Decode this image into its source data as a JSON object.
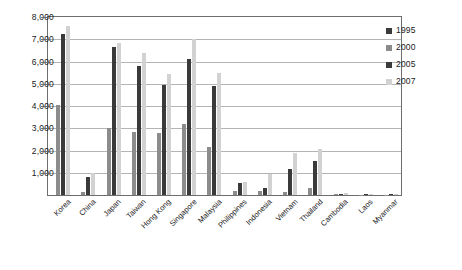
{
  "chart_data": {
    "type": "bar",
    "title": "",
    "subtitle": "",
    "xlabel": "",
    "ylabel": "",
    "ylim": [
      0,
      8000
    ],
    "yticks": [
      "0",
      "1,000",
      "2,000",
      "3,000",
      "4,000",
      "5,000",
      "6,000",
      "7,000",
      "8,000"
    ],
    "ytick_values": [
      0,
      1000,
      2000,
      3000,
      4000,
      5000,
      6000,
      7000,
      8000
    ],
    "grid": true,
    "legend_position": "right",
    "categories": [
      "Korea",
      "China",
      "Japan",
      "Taiwan",
      "Hong Kong",
      "Singapore",
      "Malaysia",
      "Philippines",
      "Indonesia",
      "Vietnam",
      "Thailand",
      "Cambodia",
      "Laos",
      "Myanmar"
    ],
    "series": [
      {
        "name": "1995",
        "color": "#3a3a3a",
        "values": [
          0,
          0,
          0,
          0,
          0,
          0,
          0,
          0,
          0,
          0,
          0,
          0,
          0,
          0
        ]
      },
      {
        "name": "2000",
        "color": "#8c8c8c",
        "values": [
          4050,
          150,
          3000,
          2850,
          2800,
          3200,
          2150,
          180,
          170,
          120,
          330,
          30,
          20,
          15
        ]
      },
      {
        "name": "2005",
        "color": "#3a3a3a",
        "values": [
          7250,
          800,
          6650,
          5800,
          4950,
          6100,
          4900,
          540,
          320,
          1150,
          1550,
          60,
          35,
          30
        ]
      },
      {
        "name": "2007",
        "color": "#d2d2d2",
        "values": [
          7600,
          1000,
          6820,
          6400,
          5450,
          7000,
          5500,
          600,
          930,
          1900,
          2050,
          90,
          55,
          60
        ]
      }
    ]
  },
  "legend": {
    "entries": [
      {
        "label": "1995",
        "color": "#3a3a3a"
      },
      {
        "label": "2000",
        "color": "#8c8c8c"
      },
      {
        "label": "2005",
        "color": "#3a3a3a"
      },
      {
        "label": "2007",
        "color": "#d2d2d2"
      }
    ]
  }
}
